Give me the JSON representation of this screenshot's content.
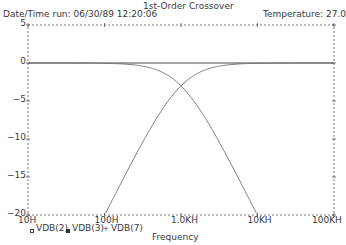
{
  "header": {
    "title": "1st-Order Crossover",
    "date_time": "Date/Time run: 06/30/89  12:20:06",
    "temperature": "Temperature:  27.0"
  },
  "chart_data": {
    "type": "line",
    "title": "1st-Order Crossover",
    "xlabel": "Frequency",
    "ylabel": "",
    "xscale": "log",
    "xlim": [
      10,
      100000
    ],
    "ylim": [
      -20,
      5
    ],
    "x_tick_labels": [
      "10H",
      "100H",
      "1.0KH",
      "10KH",
      "100KH"
    ],
    "x_tick_values": [
      10,
      100,
      1000,
      10000,
      100000
    ],
    "y_tick_labels": [
      "5",
      "0",
      "-5",
      "-10",
      "-15",
      "-20"
    ],
    "y_tick_values": [
      5,
      0,
      -5,
      -10,
      -15,
      -20
    ],
    "grid": "dotted frame with tick marks",
    "legend_position": "bottom-left",
    "crossover_frequency_hz": 1000,
    "series": [
      {
        "name": "VDB(2)",
        "marker": "open-square",
        "description": "flat 0 dB input",
        "x": [
          10,
          100,
          1000,
          10000,
          100000
        ],
        "values": [
          0,
          0,
          0,
          0,
          0
        ]
      },
      {
        "name": "VDB(3)",
        "marker": "filled-square",
        "description": "low-pass",
        "x": [
          10,
          100,
          300,
          1000,
          3000,
          10000,
          100000
        ],
        "values": [
          0,
          -0.04,
          -0.37,
          -3.01,
          -10.0,
          -20.04,
          -40.0
        ]
      },
      {
        "name": "VDB(7)",
        "marker": "cross",
        "description": "high-pass",
        "x": [
          10,
          100,
          300,
          1000,
          3000,
          10000,
          100000
        ],
        "values": [
          -40.0,
          -20.04,
          -10.8,
          -3.01,
          -0.46,
          -0.04,
          0
        ]
      }
    ]
  },
  "legend": {
    "items": [
      {
        "label": "VDB(2)"
      },
      {
        "label": "VDB(3)"
      },
      {
        "label": "VDB(7)"
      }
    ]
  },
  "colors": {
    "axis": "#555555",
    "curve": "#6e6e6e",
    "zero_line": "#444444"
  }
}
